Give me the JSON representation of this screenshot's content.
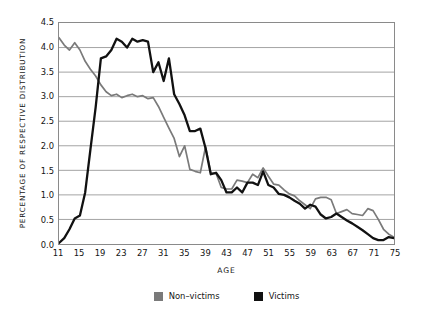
{
  "chart_data": {
    "type": "line",
    "title": "",
    "xlabel": "AGE",
    "ylabel": "PERCENTAGE OF RESPECTIVE DISTRIBUTION",
    "xlim": [
      11,
      75
    ],
    "ylim": [
      0.0,
      4.5
    ],
    "grid": true,
    "legend_position": "bottom-center",
    "x_tick_labels": [
      "11",
      "15",
      "19",
      "23",
      "27",
      "31",
      "35",
      "39",
      "43",
      "47",
      "51",
      "55",
      "59",
      "63",
      "67",
      "71",
      "75"
    ],
    "y_tick_labels": [
      "0.0",
      "0.5",
      "1.0",
      "1.5",
      "2.0",
      "2.5",
      "3.0",
      "3.5",
      "4.0",
      "4.5"
    ],
    "x": [
      11,
      12,
      13,
      14,
      15,
      16,
      17,
      18,
      19,
      20,
      21,
      22,
      23,
      24,
      25,
      26,
      27,
      28,
      29,
      30,
      31,
      32,
      33,
      34,
      35,
      36,
      37,
      38,
      39,
      40,
      41,
      42,
      43,
      44,
      45,
      46,
      47,
      48,
      49,
      50,
      51,
      52,
      53,
      54,
      55,
      56,
      57,
      58,
      59,
      60,
      61,
      62,
      63,
      64,
      65,
      66,
      67,
      68,
      69,
      70,
      71,
      72,
      73,
      74,
      75
    ],
    "series": [
      {
        "name": "Non-victims",
        "color": "#7a7a7a",
        "values": [
          4.2,
          4.05,
          3.95,
          4.1,
          3.95,
          3.72,
          3.56,
          3.42,
          3.24,
          3.1,
          3.02,
          3.05,
          2.98,
          3.02,
          3.05,
          3.0,
          3.02,
          2.96,
          2.98,
          2.8,
          2.58,
          2.36,
          2.15,
          1.78,
          2.0,
          1.52,
          1.48,
          1.45,
          1.98,
          1.45,
          1.44,
          1.15,
          1.12,
          1.12,
          1.3,
          1.28,
          1.25,
          1.42,
          1.35,
          1.55,
          1.38,
          1.22,
          1.2,
          1.1,
          1.02,
          0.98,
          0.88,
          0.8,
          0.72,
          0.92,
          0.95,
          0.95,
          0.9,
          0.62,
          0.66,
          0.7,
          0.62,
          0.6,
          0.58,
          0.72,
          0.68,
          0.5,
          0.3,
          0.2,
          0.14
        ]
      },
      {
        "name": "Victims",
        "color": "#111111",
        "values": [
          0.02,
          0.12,
          0.3,
          0.52,
          0.58,
          1.05,
          1.92,
          2.78,
          3.78,
          3.82,
          3.95,
          4.18,
          4.12,
          4.0,
          4.18,
          4.12,
          4.15,
          4.12,
          3.5,
          3.7,
          3.32,
          3.78,
          3.05,
          2.85,
          2.62,
          2.3,
          2.3,
          2.35,
          1.95,
          1.42,
          1.45,
          1.3,
          1.05,
          1.05,
          1.15,
          1.05,
          1.25,
          1.25,
          1.2,
          1.48,
          1.2,
          1.15,
          1.02,
          1.0,
          0.95,
          0.88,
          0.82,
          0.72,
          0.8,
          0.76,
          0.6,
          0.52,
          0.55,
          0.62,
          0.55,
          0.48,
          0.42,
          0.35,
          0.28,
          0.2,
          0.12,
          0.08,
          0.08,
          0.14,
          0.12
        ]
      }
    ]
  },
  "legend": {
    "items": [
      {
        "label": "Non–victims",
        "color": "#7a7a7a",
        "swatch_name": "legend-swatch-nonvictims"
      },
      {
        "label": "Victims",
        "color": "#111111",
        "swatch_name": "legend-swatch-victims"
      }
    ]
  }
}
